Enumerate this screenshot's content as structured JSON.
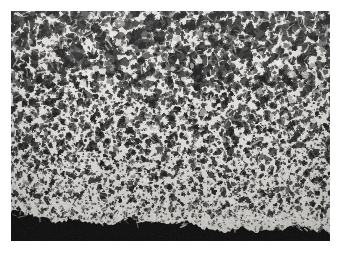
{
  "page": {
    "width": 342,
    "height": 253,
    "background_color": "#ffffff",
    "content_type": "scientific-micrograph"
  },
  "figure": {
    "name": "micrograph",
    "description": "Grayscale micrograph of a porous cellular foam material showing dark polygonal pores separated by bright cell walls",
    "frame": {
      "x": 11,
      "y": 11,
      "width": 319,
      "height": 230
    },
    "palette": {
      "matrix_light": "#e8e6e2",
      "matrix_mid": "#b9b6b1",
      "wall_bright": "#f4f2ee",
      "pore_dark": "#141414",
      "pore_mid": "#2e2e2e",
      "base_black": "#070707",
      "background": "#ffffff",
      "grain": "#8a8a8a"
    },
    "regions": [
      {
        "name": "upper-coarse-pore-zone",
        "y_start": 0,
        "y_end": 0.33,
        "pore_scale": 1.22,
        "density": 0.78,
        "brightness": 0.94
      },
      {
        "name": "middle-mixed-pore-zone",
        "y_start": 0.33,
        "y_end": 0.62,
        "pore_scale": 1.0,
        "density": 0.84,
        "brightness": 0.9
      },
      {
        "name": "lower-fine-pore-zone",
        "y_start": 0.62,
        "y_end": 0.9,
        "pore_scale": 0.78,
        "density": 0.92,
        "brightness": 0.86
      },
      {
        "name": "basal-dense-layer",
        "y_start": 0.9,
        "y_end": 1.0,
        "pore_scale": 0.6,
        "density": 0.5,
        "brightness": 0.5
      }
    ],
    "basal_band": {
      "name": "solid-black-substrate-band",
      "present": true,
      "left_height": 26,
      "right_height": 9,
      "edge": "irregular-scalloped",
      "color": "#070707"
    },
    "annotations": {
      "scale_bar": null,
      "label_text": null,
      "magnification": null
    }
  }
}
